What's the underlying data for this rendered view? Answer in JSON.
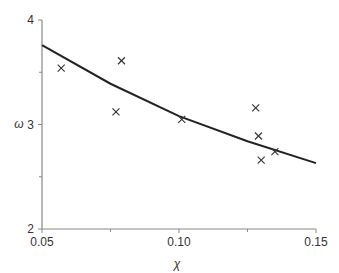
{
  "chart_data": {
    "type": "scatter",
    "title": "",
    "xlabel": "χ",
    "ylabel": "ω",
    "xlim": [
      0.05,
      0.15
    ],
    "ylim": [
      2,
      4
    ],
    "x_ticks": [
      "0.05",
      "0.10",
      "0.15"
    ],
    "y_ticks": [
      "2",
      "3",
      "4"
    ],
    "grid": false,
    "legend": null,
    "series": [
      {
        "name": "data",
        "kind": "scatter",
        "marker": "x",
        "x": [
          0.057,
          0.079,
          0.077,
          0.101,
          0.128,
          0.129,
          0.13,
          0.135
        ],
        "y": [
          3.54,
          3.61,
          3.12,
          3.05,
          3.16,
          2.89,
          2.66,
          2.74
        ]
      },
      {
        "name": "fit",
        "kind": "line",
        "x": [
          0.05,
          0.075,
          0.1,
          0.125,
          0.15
        ],
        "y": [
          3.76,
          3.39,
          3.08,
          2.84,
          2.63
        ]
      }
    ]
  },
  "axes": {
    "xlabel": "χ",
    "ylabel": "ω"
  }
}
